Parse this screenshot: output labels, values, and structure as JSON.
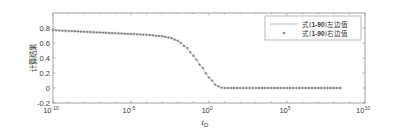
{
  "chart_data": {
    "type": "line",
    "title": "",
    "xlabel": "t_D",
    "ylabel": "计算结果",
    "xscale": "log",
    "xlim_exp": [
      -10,
      10
    ],
    "ylim": [
      -0.2,
      1.0
    ],
    "x_ticks": [
      {
        "base": "10",
        "exp": "-10",
        "value_exp": -10
      },
      {
        "base": "10",
        "exp": "-5",
        "value_exp": -5
      },
      {
        "base": "10",
        "exp": "0",
        "value_exp": 0
      },
      {
        "base": "10",
        "exp": "5",
        "value_exp": 5
      },
      {
        "base": "10",
        "exp": "10",
        "value_exp": 10
      }
    ],
    "y_ticks": [
      "-0.2",
      "0",
      "0.2",
      "0.4",
      "0.6",
      "0.8"
    ],
    "y_tick_values": [
      -0.2,
      0,
      0.2,
      0.4,
      0.6,
      0.8
    ],
    "grid": false,
    "legend_position": "upper right",
    "series": [
      {
        "name": "式(1-90)左边值",
        "style": "line",
        "color": "#9a9a9a",
        "log10_x": [
          -10,
          -9,
          -8,
          -7,
          -6,
          -5,
          -4,
          -3,
          -2.5,
          -2,
          -1.5,
          -1,
          -0.5,
          0,
          0.5,
          0.8,
          1,
          2,
          3,
          4,
          5,
          6,
          7,
          8,
          8.5
        ],
        "y": [
          0.77,
          0.76,
          0.75,
          0.74,
          0.73,
          0.72,
          0.71,
          0.69,
          0.67,
          0.63,
          0.55,
          0.43,
          0.29,
          0.14,
          0.03,
          0.005,
          0,
          0,
          0,
          0,
          0,
          0,
          0,
          0,
          0
        ]
      },
      {
        "name": "式(1-90)右边值",
        "style": "marker",
        "marker": "*",
        "color": "#7a7a7a",
        "log10_x": [
          -10,
          -9,
          -8,
          -7,
          -6,
          -5,
          -4,
          -3,
          -2.5,
          -2,
          -1.5,
          -1,
          -0.5,
          0,
          0.5,
          0.8,
          1,
          2,
          3,
          4,
          5,
          6,
          7,
          8,
          8.5
        ],
        "y": [
          0.77,
          0.76,
          0.75,
          0.74,
          0.73,
          0.72,
          0.71,
          0.69,
          0.67,
          0.63,
          0.55,
          0.43,
          0.29,
          0.14,
          0.03,
          0.005,
          0,
          0,
          0,
          0,
          0,
          0,
          0,
          0,
          0
        ]
      }
    ]
  },
  "legend": {
    "items": [
      {
        "label_prefix": "式(",
        "label_bold": "1-90",
        "label_suffix": ")左边值"
      },
      {
        "label_prefix": "式(",
        "label_bold": "1-90",
        "label_suffix": ")右边值"
      }
    ]
  },
  "colors": {
    "axis": "#8c8c8c",
    "line": "#a0a0a0",
    "marker": "#6f6f6f"
  }
}
